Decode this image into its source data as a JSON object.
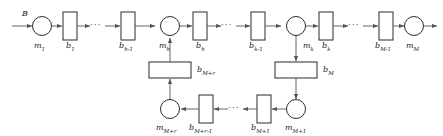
{
  "diagram": {
    "input_label": "B",
    "ellipsis": "···",
    "colors": {
      "stroke": "#2b2b2b",
      "arrow": "#555555",
      "text": "#1a1a1a",
      "background": "#ffffff"
    },
    "top_row": {
      "machines": [
        {
          "id": "m1",
          "base": "m",
          "sub": "1"
        },
        {
          "id": "mh",
          "base": "m",
          "sub": "h"
        },
        {
          "id": "mk",
          "base": "m",
          "sub": "k"
        },
        {
          "id": "mM",
          "base": "m",
          "sub": "M"
        }
      ],
      "buffers": [
        {
          "id": "b1",
          "base": "b",
          "sub": "1"
        },
        {
          "id": "bh1",
          "base": "b",
          "sub": "h-1"
        },
        {
          "id": "bh",
          "base": "b",
          "sub": "h"
        },
        {
          "id": "bk1",
          "base": "b",
          "sub": "k-1"
        },
        {
          "id": "bk",
          "base": "b",
          "sub": "k"
        },
        {
          "id": "bM1",
          "base": "b",
          "sub": "M-1"
        }
      ]
    },
    "loop": {
      "down_buffer": {
        "id": "bM",
        "base": "b",
        "sub": "M"
      },
      "up_buffer": {
        "id": "bMr",
        "base": "b",
        "sub": "M+r"
      },
      "machines": [
        {
          "id": "mMr",
          "base": "m",
          "sub": "M+r"
        },
        {
          "id": "mM1",
          "base": "m",
          "sub": "M+1"
        }
      ],
      "buffers": [
        {
          "id": "bMr1",
          "base": "b",
          "sub": "M+r-1"
        },
        {
          "id": "bMp1",
          "base": "b",
          "sub": "M+1"
        }
      ]
    }
  }
}
